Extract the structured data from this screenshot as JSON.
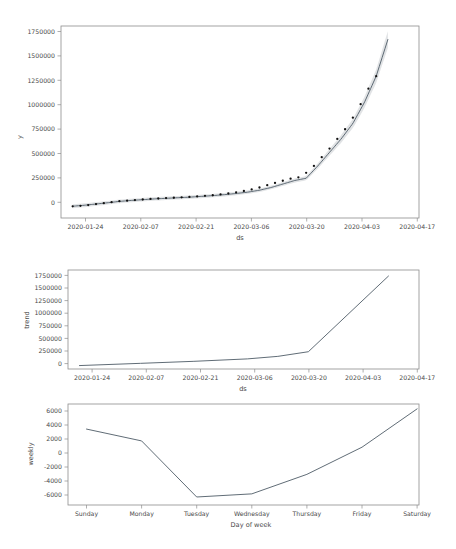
{
  "figure": {
    "background_color": "#ffffff",
    "line_color": "#4e5b66",
    "point_color": "#111111",
    "band_color": "#c8ccd0"
  },
  "chart_data": [
    {
      "id": "forecast",
      "type": "line",
      "title": "",
      "xlabel": "ds",
      "ylabel": "y",
      "xtick_labels": [
        "2020-01-24",
        "2020-02-07",
        "2020-02-21",
        "2020-03-06",
        "2020-03-20",
        "2020-04-03",
        "2020-04-17"
      ],
      "ytick_labels": [
        "0",
        "250000",
        "500000",
        "750000",
        "1000000",
        "1250000",
        "1500000",
        "1750000"
      ],
      "ylim": [
        -120000,
        1870000
      ],
      "xlim": [
        "2020-01-19",
        "2020-04-20"
      ],
      "grid": false,
      "legend": "none",
      "series": [
        {
          "name": "yhat",
          "x": [
            "2020-01-22",
            "2020-01-25",
            "2020-01-28",
            "2020-01-31",
            "2020-02-03",
            "2020-02-06",
            "2020-02-09",
            "2020-02-12",
            "2020-02-15",
            "2020-02-18",
            "2020-02-21",
            "2020-02-24",
            "2020-02-27",
            "2020-03-01",
            "2020-03-04",
            "2020-03-07",
            "2020-03-10",
            "2020-03-13",
            "2020-03-16",
            "2020-03-19",
            "2020-03-22",
            "2020-03-25",
            "2020-03-28",
            "2020-03-31",
            "2020-04-03",
            "2020-04-06",
            "2020-04-09",
            "2020-04-12"
          ],
          "values": [
            2000,
            12000,
            25000,
            38000,
            52000,
            62000,
            70000,
            78000,
            84000,
            90000,
            96000,
            104000,
            112000,
            122000,
            134000,
            148000,
            168000,
            196000,
            232000,
            268000,
            292000,
            420000,
            560000,
            700000,
            860000,
            1080000,
            1350000,
            1730000
          ]
        },
        {
          "name": "yhat_lower",
          "x": [
            "2020-01-22",
            "2020-02-06",
            "2020-02-21",
            "2020-03-07",
            "2020-03-19",
            "2020-03-22",
            "2020-04-12"
          ],
          "values": [
            -18000,
            44000,
            78000,
            130000,
            250000,
            274000,
            1700000
          ]
        },
        {
          "name": "yhat_upper",
          "x": [
            "2020-01-22",
            "2020-02-06",
            "2020-02-21",
            "2020-03-07",
            "2020-03-19",
            "2020-03-22",
            "2020-04-12"
          ],
          "values": [
            22000,
            80000,
            114000,
            166000,
            286000,
            310000,
            1760000
          ]
        },
        {
          "name": "observed",
          "x": [
            "2020-01-22",
            "2020-01-24",
            "2020-01-26",
            "2020-01-28",
            "2020-01-30",
            "2020-02-01",
            "2020-02-03",
            "2020-02-05",
            "2020-02-07",
            "2020-02-09",
            "2020-02-11",
            "2020-02-13",
            "2020-02-15",
            "2020-02-17",
            "2020-02-19",
            "2020-02-21",
            "2020-02-23",
            "2020-02-25",
            "2020-02-27",
            "2020-02-29",
            "2020-03-02",
            "2020-03-04",
            "2020-03-06",
            "2020-03-08",
            "2020-03-10",
            "2020-03-12",
            "2020-03-14",
            "2020-03-16",
            "2020-03-18",
            "2020-03-20",
            "2020-03-22",
            "2020-03-24",
            "2020-03-26",
            "2020-03-28",
            "2020-03-30",
            "2020-04-01",
            "2020-04-03",
            "2020-04-05",
            "2020-04-07",
            "2020-04-09"
          ],
          "values": [
            1000,
            6000,
            14000,
            24000,
            34000,
            44000,
            54000,
            60000,
            66000,
            72000,
            78000,
            82000,
            86000,
            90000,
            94000,
            98000,
            104000,
            110000,
            116000,
            124000,
            134000,
            146000,
            160000,
            176000,
            196000,
            220000,
            244000,
            266000,
            288000,
            302000,
            348000,
            420000,
            510000,
            600000,
            700000,
            800000,
            920000,
            1060000,
            1220000,
            1350000
          ]
        }
      ]
    },
    {
      "id": "trend",
      "type": "line",
      "title": "",
      "xlabel": "ds",
      "ylabel": "trend",
      "xtick_labels": [
        "2020-01-24",
        "2020-02-07",
        "2020-02-21",
        "2020-03-06",
        "2020-03-20",
        "2020-04-03",
        "2020-04-17"
      ],
      "ytick_labels": [
        "0",
        "250000",
        "500000",
        "750000",
        "1000000",
        "1250000",
        "1500000",
        "1750000"
      ],
      "ylim": [
        -60000,
        1900000
      ],
      "grid": false,
      "legend": "none",
      "series": [
        {
          "name": "trend",
          "x": [
            "2020-01-22",
            "2020-02-07",
            "2020-02-21",
            "2020-03-06",
            "2020-03-14",
            "2020-03-22",
            "2020-04-12"
          ],
          "values": [
            8000,
            52000,
            92000,
            140000,
            190000,
            282000,
            1780000
          ]
        }
      ]
    },
    {
      "id": "weekly",
      "type": "line",
      "title": "",
      "xlabel": "Day of week",
      "ylabel": "weekly",
      "categories": [
        "Sunday",
        "Monday",
        "Tuesday",
        "Wednesday",
        "Thursday",
        "Friday",
        "Saturday"
      ],
      "ytick_labels": [
        "-6000",
        "-4000",
        "-2000",
        "0",
        "2000",
        "4000",
        "6000"
      ],
      "ylim": [
        -6900,
        7600
      ],
      "grid": false,
      "legend": "none",
      "series": [
        {
          "name": "weekly",
          "values": [
            4000,
            2300,
            -5750,
            -5300,
            -2500,
            1400,
            6900
          ]
        }
      ]
    }
  ]
}
